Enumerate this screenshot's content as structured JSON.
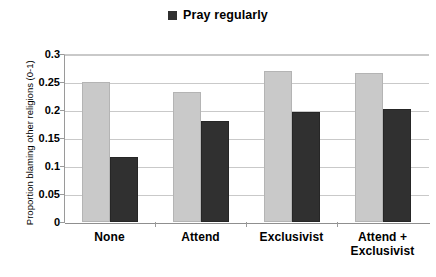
{
  "chart_data": {
    "type": "bar",
    "title": "",
    "xlabel": "",
    "ylabel": "Proportion blaming other religions (0-1)",
    "categories": [
      "None",
      "Attend",
      "Exclusivist",
      "Attend + Exclusivist"
    ],
    "category_lines": [
      [
        "None"
      ],
      [
        "Attend"
      ],
      [
        "Exclusivist"
      ],
      [
        "Attend +",
        "Exclusivist"
      ]
    ],
    "series": [
      {
        "name": "",
        "color": "#c9c9c9",
        "values": [
          0.25,
          0.232,
          0.27,
          0.266
        ]
      },
      {
        "name": "Pray regularly",
        "color": "#303030",
        "values": [
          0.116,
          0.181,
          0.197,
          0.201
        ]
      }
    ],
    "ylim": [
      0,
      0.3
    ],
    "yticks": [
      "0",
      "0.05",
      "0.1",
      "0.15",
      "0.2",
      "0.25",
      "0.3"
    ],
    "ytick_values": [
      0,
      0.05,
      0.1,
      0.15,
      0.2,
      0.25,
      0.3
    ],
    "grid": true,
    "legend_position": "top-center"
  },
  "legend": {
    "entries": [
      {
        "label": "Pray regularly",
        "color": "#303030",
        "marker": "square"
      }
    ]
  }
}
